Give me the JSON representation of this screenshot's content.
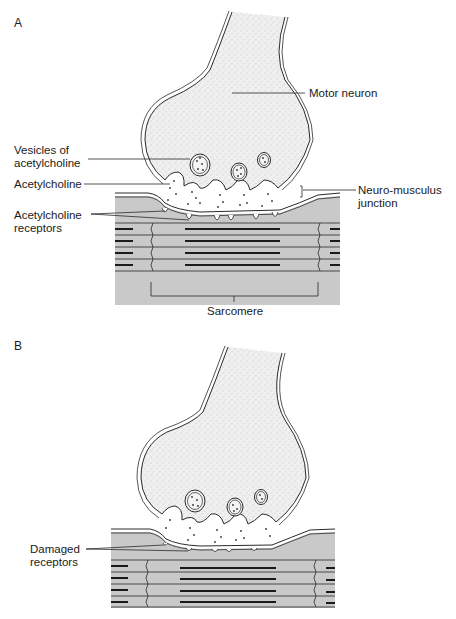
{
  "panels": [
    {
      "id": "A",
      "label": "A",
      "annotations": {
        "motor_neuron": "Motor neuron",
        "vesicles_line1": "Vesicles of",
        "vesicles_line2": "acetylcholine",
        "acetylcholine": "Acetylcholine",
        "nmj_line1": "Neuro-musculus",
        "nmj_line2": "junction",
        "receptors_line1": "Acetylcholine",
        "receptors_line2": "receptors",
        "sarcomere": "Sarcomere"
      }
    },
    {
      "id": "B",
      "label": "B",
      "annotations": {
        "damaged_line1": "Damaged",
        "damaged_line2": "receptors"
      }
    }
  ],
  "colors": {
    "muscle_fill": "#c9c9c9",
    "neuron_fill": "#ececec",
    "outline": "#2a2a2a",
    "background": "#ffffff"
  }
}
